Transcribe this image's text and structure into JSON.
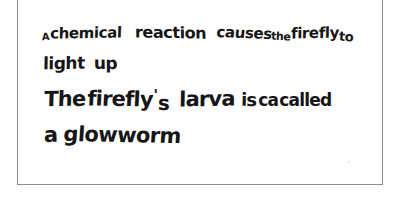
{
  "document": {
    "kind": "handwritten-answer-scan",
    "ink_color": "#161616",
    "paper_color": "#ffffff",
    "border_color": "#8d8d8d",
    "full_text": "A chemical reaction causes the firefly to light up. The firefly's larva is ca called a glowworm",
    "lines": [
      {
        "id": "line-1",
        "text": "A chemical reaction causes the firefly to",
        "words": [
          "A",
          "chemical",
          "reaction",
          "causes",
          "the",
          "firefly",
          "to"
        ]
      },
      {
        "id": "line-2",
        "text": "light up",
        "words": [
          "light",
          "up"
        ]
      },
      {
        "id": "line-3",
        "text": "The firefly 's larva is ca called",
        "words": [
          "The",
          "firefly",
          "'",
          "s",
          "larva",
          "is",
          "ca",
          "called"
        ]
      },
      {
        "id": "line-4",
        "text": "a glowworm",
        "words": [
          "a",
          "glowworm"
        ]
      }
    ]
  }
}
